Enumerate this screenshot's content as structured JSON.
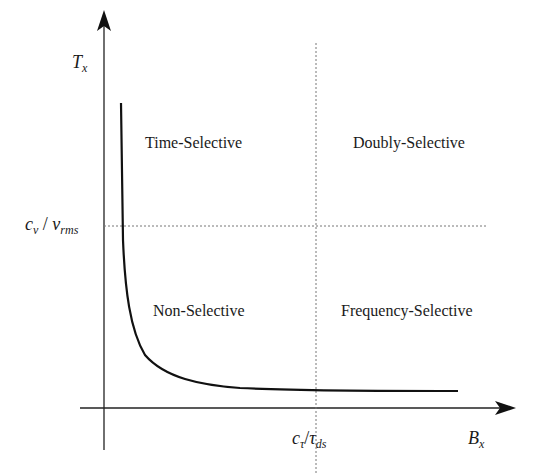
{
  "diagram": {
    "axes": {
      "y_label": {
        "main": "T",
        "sub": "x"
      },
      "x_label": {
        "main": "B",
        "sub": "x"
      }
    },
    "thresholds": {
      "y_threshold": {
        "c": "c",
        "c_sub": "ν",
        "slash": " / ",
        "v": "ν",
        "v_sub": "rms"
      },
      "x_threshold": {
        "c": "c",
        "c_sub": "τ",
        "slash": "/",
        "t": "τ",
        "t_sub": "ds"
      }
    },
    "regions": {
      "top_left": "Time-Selective",
      "top_right": "Doubly-Selective",
      "bottom_left": "Non-Selective",
      "bottom_right": "Frequency-Selective"
    },
    "colors": {
      "line": "#111111",
      "dotted": "#777777",
      "background": "#ffffff"
    }
  }
}
